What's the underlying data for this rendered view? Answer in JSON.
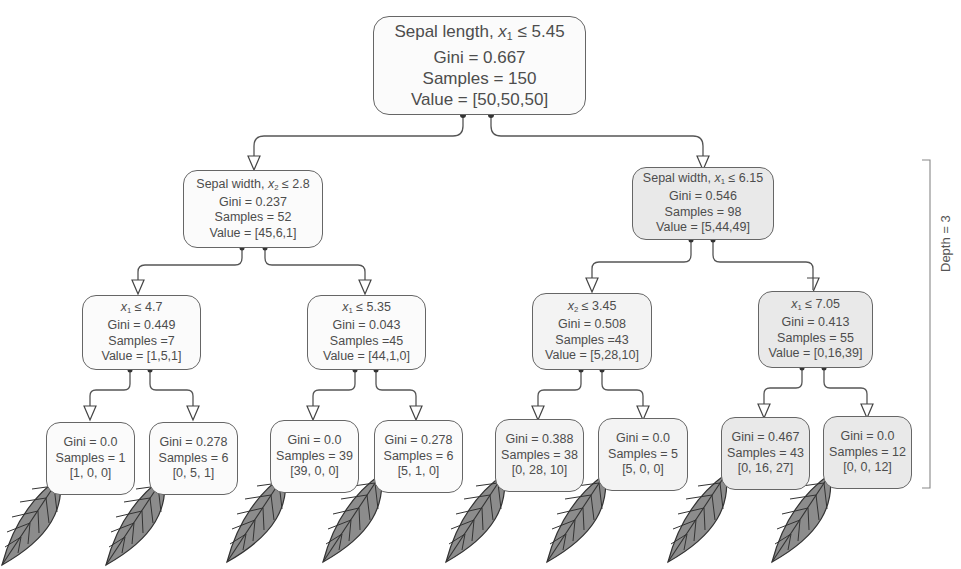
{
  "tree": {
    "root": {
      "feature": "Sepal length, ",
      "var": "x",
      "sub": "1",
      "op": " ≤ 5.45",
      "gini": "Gini = 0.667",
      "samples": "Samples = 150",
      "value": "Value = [50,50,50]"
    },
    "left": {
      "feature": "Sepal width, ",
      "var": "x",
      "sub": "2",
      "op": " ≤ 2.8",
      "gini": "Gini = 0.237",
      "samples": "Samples = 52",
      "value": "Value = [45,6,1]"
    },
    "right": {
      "feature": "Sepal width, ",
      "var": "x",
      "sub": "1",
      "op": " ≤ 6.15",
      "gini": "Gini = 0.546",
      "samples": "Samples = 98",
      "value": "Value = [5,44,49]"
    },
    "level2": [
      {
        "var": "x",
        "sub": "1",
        "op": " ≤ 4.7",
        "gini": "Gini = 0.449",
        "samples": "Samples =7",
        "value": "Value = [1,5,1]"
      },
      {
        "var": "x",
        "sub": "1",
        "op": " ≤ 5.35",
        "gini": "Gini = 0.043",
        "samples": "Samples =45",
        "value": "Value = [44,1,0]"
      },
      {
        "var": "x",
        "sub": "2",
        "op": " ≤ 3.45",
        "gini": "Gini = 0.508",
        "samples": "Samples =43",
        "value": "Value = [5,28,10]"
      },
      {
        "var": "x",
        "sub": "1",
        "op": " ≤ 7.05",
        "gini": "Gini = 0.413",
        "samples": "Samples = 55",
        "value": "Value = [0,16,39]"
      }
    ],
    "leaves": [
      {
        "gini": "Gini = 0.0",
        "samples": "Samples = 1",
        "value": "[1, 0, 0]"
      },
      {
        "gini": "Gini = 0.278",
        "samples": "Samples = 6",
        "value": "[0, 5, 1]"
      },
      {
        "gini": "Gini = 0.0",
        "samples": "Samples = 39",
        "value": "[39, 0, 0]"
      },
      {
        "gini": "Gini = 0.278",
        "samples": "Samples = 6",
        "value": "[5, 1, 0]"
      },
      {
        "gini": "Gini = 0.388",
        "samples": "Samples = 38",
        "value": "[0, 28, 10]"
      },
      {
        "gini": "Gini = 0.0",
        "samples": "Samples = 5",
        "value": "[5, 0, 0]"
      },
      {
        "gini": "Gini = 0.467",
        "samples": "Samples = 43",
        "value": "[0, 16, 27]"
      },
      {
        "gini": "Gini = 0.0",
        "samples": "Samples = 12",
        "value": "[0, 0, 12]"
      }
    ]
  },
  "annotation": {
    "depth_label": "Depth = 3"
  },
  "colors": {
    "line": "#555555",
    "node_border": "#666666",
    "leaf_icon_fill": "#8c8c8c",
    "leaf_icon_stroke": "#333333"
  }
}
